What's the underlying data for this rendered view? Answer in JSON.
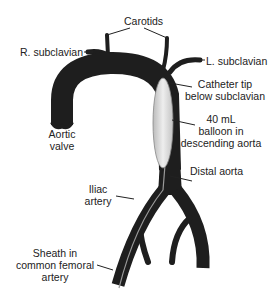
{
  "diagram": {
    "labels": {
      "carotids": "Carotids",
      "r_subclavian": "R. subclavian",
      "l_subclavian": "L. subclavian",
      "catheter_tip_1": "Catheter tip",
      "catheter_tip_2": "below subclavian",
      "balloon_1": "40 mL",
      "balloon_2": "balloon in",
      "balloon_3": "descending aorta",
      "aortic_valve_1": "Aortic",
      "aortic_valve_2": "valve",
      "distal_aorta": "Distal aorta",
      "iliac_1": "Iliac",
      "iliac_2": "artery",
      "sheath_1": "Sheath in",
      "sheath_2": "common femoral",
      "sheath_3": "artery"
    },
    "colors": {
      "vessel": "#1e1e1e",
      "balloon": "#d8d8d8",
      "leader": "#222222",
      "text": "#222222"
    }
  }
}
